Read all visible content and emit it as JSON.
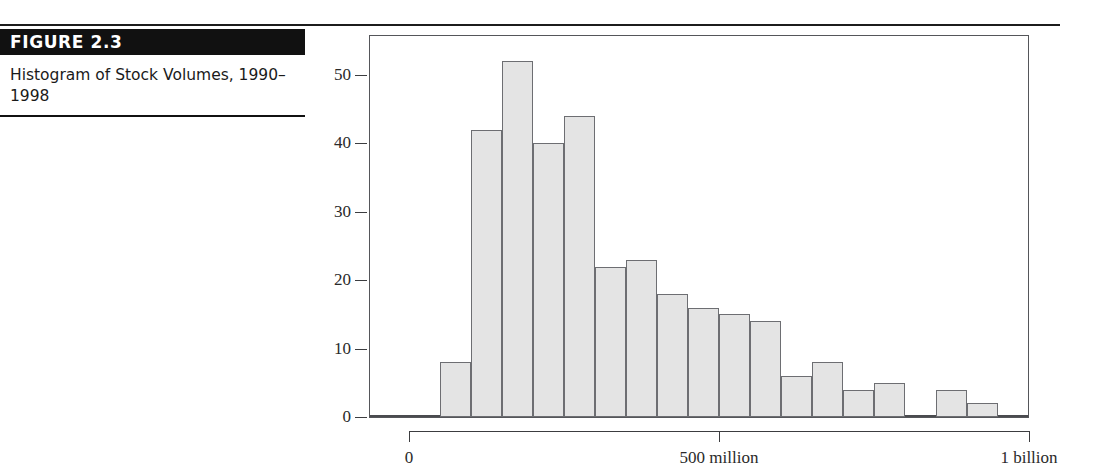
{
  "figure": {
    "label": "FIGURE 2.3",
    "caption": "Histogram of Stock Volumes, 1990–1998"
  },
  "chart_data": {
    "type": "bar",
    "title": "Histogram of Stock Volumes, 1990–1998",
    "xlabel": "",
    "ylabel": "",
    "grid": false,
    "legend": null,
    "ylim": [
      0,
      55
    ],
    "xlim": [
      0,
      1000
    ],
    "y_ticks": [
      0,
      10,
      20,
      30,
      40,
      50
    ],
    "y_tick_labels": [
      "0",
      "10",
      "20",
      "30",
      "40",
      "50"
    ],
    "x_ticks": [
      0,
      500,
      1000
    ],
    "x_tick_labels": [
      "0",
      "500 million",
      "1 billion"
    ],
    "bin_width_millions": 50,
    "bin_starts": [
      50,
      100,
      150,
      200,
      250,
      300,
      350,
      400,
      450,
      500,
      550,
      600,
      650,
      700,
      750,
      800,
      850,
      900,
      950
    ],
    "values": [
      8,
      42,
      52,
      40,
      44,
      22,
      23,
      18,
      16,
      15,
      14,
      6,
      8,
      4,
      5,
      0,
      4,
      2,
      0
    ],
    "bar_fill": "#e4e4e4",
    "bar_stroke": "#6d6e72"
  }
}
